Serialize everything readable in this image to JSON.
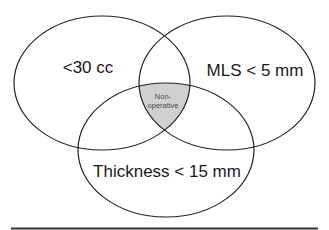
{
  "diagram": {
    "type": "venn-3",
    "sets": [
      {
        "id": "volume",
        "label": "<30 cc",
        "cx": 102,
        "cy": 83,
        "rx": 88,
        "ry": 67
      },
      {
        "id": "mls",
        "label": "MLS < 5 mm",
        "cx": 227,
        "cy": 83,
        "rx": 88,
        "ry": 67
      },
      {
        "id": "thickness",
        "label": "Thickness < 15 mm",
        "cx": 166,
        "cy": 150,
        "rx": 88,
        "ry": 67
      }
    ],
    "intersection": {
      "label_line1": "Non-",
      "label_line2": "operative",
      "fill": "#d0d0d0"
    },
    "colors": {
      "stroke": "#222222",
      "background": "#ffffff",
      "rule": "#333333"
    }
  }
}
